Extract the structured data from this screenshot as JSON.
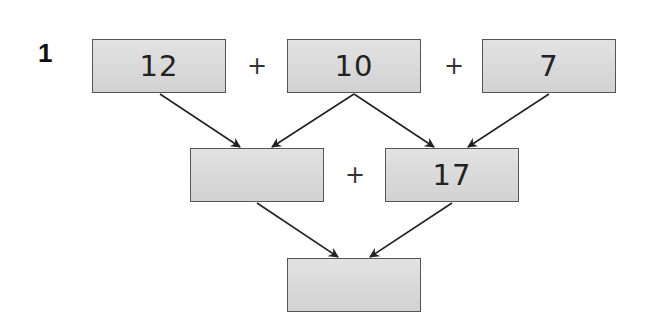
{
  "question_number": "1",
  "top_row": [
    "12",
    "10",
    "7"
  ],
  "middle_row": [
    "",
    "17"
  ],
  "bottom_row": [
    ""
  ],
  "operators": {
    "top_1": "+",
    "top_2": "+",
    "middle": "+"
  }
}
